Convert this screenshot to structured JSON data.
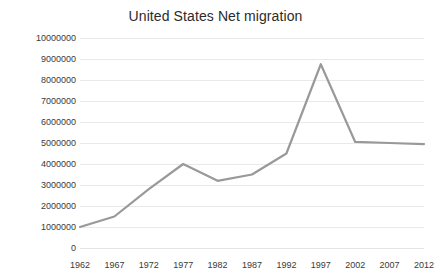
{
  "chart_data": {
    "type": "line",
    "title": "United States Net migration",
    "xlabel": "",
    "ylabel": "",
    "x": [
      1962,
      1967,
      1972,
      1977,
      1982,
      1987,
      1992,
      1997,
      2002,
      2007,
      2012
    ],
    "categories": [
      "1962",
      "1967",
      "1972",
      "1977",
      "1982",
      "1987",
      "1992",
      "1997",
      "2002",
      "2007",
      "2012"
    ],
    "values": [
      1000000,
      1500000,
      2800000,
      4000000,
      3200000,
      3500000,
      4500000,
      8750000,
      5050000,
      5000000,
      4950000
    ],
    "series": [
      {
        "name": "Net migration",
        "values": [
          1000000,
          1500000,
          2800000,
          4000000,
          3200000,
          3500000,
          4500000,
          8750000,
          5050000,
          5000000,
          4950000
        ]
      }
    ],
    "ylim": [
      0,
      10000000
    ],
    "xlim": [
      1962,
      2012
    ],
    "ytick_labels": [
      "10000000",
      "9000000",
      "8000000",
      "7000000",
      "6000000",
      "5000000",
      "4000000",
      "3000000",
      "2000000",
      "1000000",
      "0"
    ],
    "ytick_values": [
      10000000,
      9000000,
      8000000,
      7000000,
      6000000,
      5000000,
      4000000,
      3000000,
      2000000,
      1000000,
      0
    ],
    "grid": true,
    "legend": false,
    "legend_position": "none",
    "line_color": "#999999",
    "grid_color": "#e9e9e9",
    "background_color": "#ffffff",
    "text_color": "#3a3a3a"
  }
}
